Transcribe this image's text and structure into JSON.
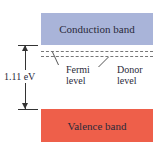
{
  "diagram": {
    "conduction_band": {
      "label": "Conduction band",
      "color": "#a9b4d9"
    },
    "valence_band": {
      "label": "Valence band",
      "color": "#ee5f4a"
    },
    "gap": {
      "label": "1.11 eV"
    },
    "levels": [
      {
        "label_line1": "Fermi",
        "label_line2": "level"
      },
      {
        "label_line1": "Donor",
        "label_line2": "level"
      }
    ]
  }
}
